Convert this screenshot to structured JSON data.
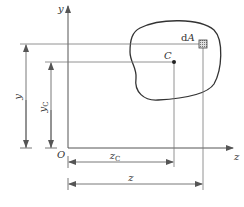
{
  "diagram": {
    "title": "",
    "axes": {
      "y_label": "y",
      "z_label": "z",
      "origin_label": "O"
    },
    "region": {
      "element_label_prefix": "d",
      "element_label_var": "A",
      "centroid_label": "C"
    },
    "dimensions": {
      "y": {
        "var": "y",
        "sub": ""
      },
      "y_c": {
        "var": "y",
        "sub": "C"
      },
      "z_c": {
        "var": "z",
        "sub": "C"
      },
      "z": {
        "var": "z",
        "sub": ""
      }
    },
    "colors": {
      "line": "#555555",
      "curve": "#333333",
      "element_fill": "#bbbbbb"
    }
  }
}
